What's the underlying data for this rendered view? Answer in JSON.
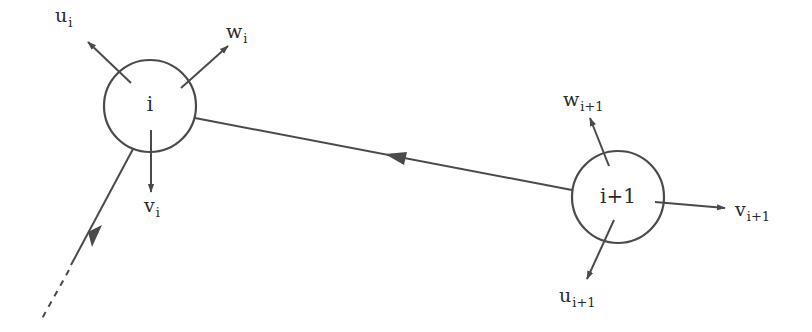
{
  "diagram": {
    "type": "node-link vector diagram",
    "stroke_color": "#4a4a4a",
    "text_color": "#2a2a2a",
    "background": "#ffffff",
    "nodes": [
      {
        "id": "i",
        "label": "i",
        "cx": 150,
        "cy": 106,
        "r": 46,
        "vectors": [
          {
            "name": "u",
            "sub": "i",
            "label_x": 42,
            "label_y": 7
          },
          {
            "name": "w",
            "sub": "i",
            "label_x": 222,
            "label_y": 25
          },
          {
            "name": "v",
            "sub": "i",
            "label_x": 144,
            "label_y": 173
          }
        ]
      },
      {
        "id": "i+1",
        "label": "i+1",
        "cx": 618,
        "cy": 197,
        "r": 46,
        "vectors": [
          {
            "name": "w",
            "sub": "i+1",
            "label_x": 563,
            "label_y": 92
          },
          {
            "name": "v",
            "sub": "i+1",
            "label_x": 735,
            "label_y": 203
          },
          {
            "name": "u",
            "sub": "i+1",
            "label_x": 558,
            "label_y": 283
          }
        ]
      }
    ],
    "edges": [
      {
        "from": "i+1",
        "to": "i",
        "style": "solid",
        "arrow": "midpoint"
      },
      {
        "from": "i",
        "to": "offscreen",
        "style": "solid-then-dashed",
        "arrow": "midpoint"
      }
    ]
  }
}
